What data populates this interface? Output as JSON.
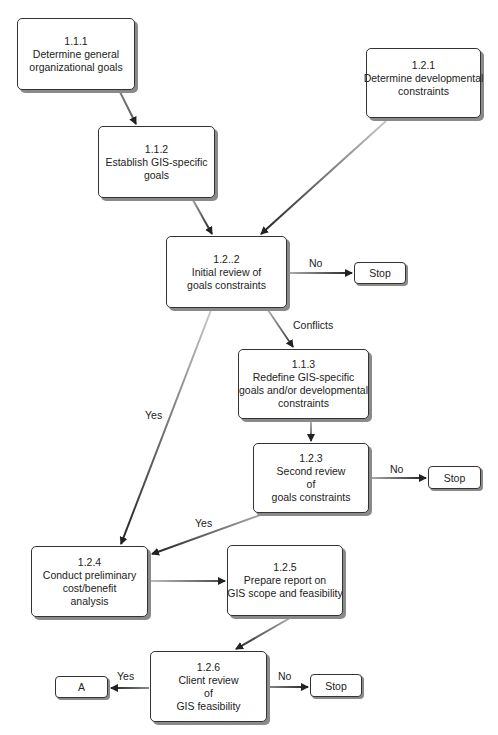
{
  "diagram": {
    "type": "flowchart",
    "nodes": {
      "n111": {
        "id": "1.1.1",
        "lines": [
          "1.1.1",
          "Determine general",
          "organizational goals"
        ]
      },
      "n112": {
        "id": "1.1.2",
        "lines": [
          "1.1.2",
          "Establish GIS-specific",
          "goals"
        ]
      },
      "n121": {
        "id": "1.2.1",
        "lines": [
          "1.2.1",
          "Determine developmental",
          "constraints"
        ]
      },
      "n122": {
        "id": "1.2..2",
        "lines": [
          "1.2..2",
          "Initial review of",
          "goals constraints"
        ]
      },
      "n113": {
        "id": "1.1.3",
        "lines": [
          "1.1.3",
          "Redefine GIS-specific",
          "goals and/or developmental",
          "constraints"
        ]
      },
      "n123": {
        "id": "1.2.3",
        "lines": [
          "1.2.3",
          "Second review",
          "of",
          "goals constraints"
        ]
      },
      "n124": {
        "id": "1.2.4",
        "lines": [
          "1.2.4",
          "Conduct preliminary",
          "cost/benefit",
          "analysis"
        ]
      },
      "n125": {
        "id": "1.2.5",
        "lines": [
          "1.2.5",
          "Prepare report on",
          "GIS scope and feasibility"
        ]
      },
      "n126": {
        "id": "1.2.6",
        "lines": [
          "1.2.6",
          "Client review",
          "of",
          "GIS feasibility"
        ]
      }
    },
    "terminals": {
      "stop1": "Stop",
      "stop2": "Stop",
      "stop3": "Stop",
      "a": "A"
    },
    "edge_labels": {
      "n122_no": "No",
      "n122_conflicts": "Conflicts",
      "n122_yes": "Yes",
      "n123_no": "No",
      "n123_yes": "Yes",
      "n126_yes": "Yes",
      "n126_no": "No"
    },
    "edges": [
      {
        "from": "1.1.1",
        "to": "1.1.2",
        "label": ""
      },
      {
        "from": "1.1.2",
        "to": "1.2..2",
        "label": ""
      },
      {
        "from": "1.2.1",
        "to": "1.2..2",
        "label": ""
      },
      {
        "from": "1.2..2",
        "to": "Stop",
        "label": "No"
      },
      {
        "from": "1.2..2",
        "to": "1.1.3",
        "label": "Conflicts"
      },
      {
        "from": "1.2..2",
        "to": "1.2.4",
        "label": "Yes"
      },
      {
        "from": "1.1.3",
        "to": "1.2.3",
        "label": ""
      },
      {
        "from": "1.2.3",
        "to": "Stop",
        "label": "No"
      },
      {
        "from": "1.2.3",
        "to": "1.2.4",
        "label": "Yes"
      },
      {
        "from": "1.2.4",
        "to": "1.2.5",
        "label": ""
      },
      {
        "from": "1.2.5",
        "to": "1.2.6",
        "label": ""
      },
      {
        "from": "1.2.6",
        "to": "A",
        "label": "Yes"
      },
      {
        "from": "1.2.6",
        "to": "Stop",
        "label": "No"
      }
    ]
  }
}
